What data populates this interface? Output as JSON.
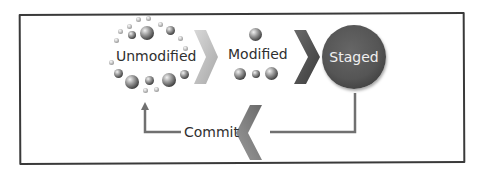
{
  "diagram": {
    "type": "git-file-lifecycle",
    "nodes": [
      {
        "id": "unmodified",
        "label": "Unmodified"
      },
      {
        "id": "modified",
        "label": "Modified"
      },
      {
        "id": "staged",
        "label": "Staged"
      }
    ],
    "edges": [
      {
        "from": "unmodified",
        "to": "modified",
        "style": "chevron"
      },
      {
        "from": "modified",
        "to": "staged",
        "style": "chevron"
      },
      {
        "from": "staged",
        "to": "unmodified",
        "label": "Commit",
        "style": "elbow-arrow-with-chevron"
      }
    ],
    "commit_label": "Commit",
    "colors": {
      "frame": "#3a3a3a",
      "text": "#2f2f2f",
      "chevron_light": "#b5b5b5",
      "chevron_dark": "#4a4a4a",
      "staged_fill": "#555555",
      "staged_text": "#f0f0f0",
      "line": "#6e6e6e"
    }
  }
}
